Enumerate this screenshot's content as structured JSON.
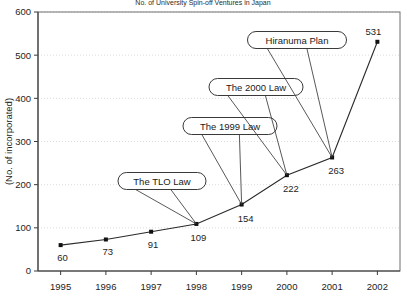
{
  "chart_data": {
    "type": "line",
    "title": "No. of University Spin-off Ventures in Japan",
    "xlabel": "",
    "ylabel": "(No. of incorporated)",
    "categories": [
      "1995",
      "1996",
      "1997",
      "1998",
      "1999",
      "2000",
      "2001",
      "2002"
    ],
    "values": [
      60,
      73,
      91,
      109,
      154,
      222,
      263,
      531
    ],
    "series": [
      {
        "name": "No. of incorporated",
        "values": [
          60,
          73,
          91,
          109,
          154,
          222,
          263,
          531
        ]
      }
    ],
    "ylim": [
      0,
      600
    ],
    "y_ticks": [
      "0",
      "100",
      "200",
      "300",
      "400",
      "500",
      "600"
    ],
    "grid": "horizontal-dotted",
    "legend": "none",
    "marker": "square",
    "line_color": "#2a2a2a",
    "marker_color": "#111111",
    "grid_color": "#cfcfcf",
    "annotations": [
      {
        "label": "The TLO Law",
        "target_year": "1998",
        "target_value": 109
      },
      {
        "label": "The 1999 Law",
        "target_year": "1999",
        "target_value": 154
      },
      {
        "label": "The 2000 Law",
        "target_year": "2000",
        "target_value": 222
      },
      {
        "label": "Hiranuma Plan",
        "target_year": "2001",
        "target_value": 263
      }
    ],
    "data_labels": [
      "60",
      "73",
      "91",
      "109",
      "154",
      "222",
      "263",
      "531"
    ]
  }
}
